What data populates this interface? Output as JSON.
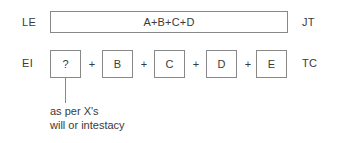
{
  "diagram": {
    "type": "estate-distribution-flow",
    "rows": [
      {
        "left_label": "LE",
        "right_label": "JT",
        "box_text": "A+B+C+D"
      },
      {
        "left_label": "EI",
        "right_label": "TC",
        "operator": "+",
        "boxes": [
          {
            "label": "?"
          },
          {
            "label": "B"
          },
          {
            "label": "C"
          },
          {
            "label": "D"
          },
          {
            "label": "E"
          }
        ]
      }
    ],
    "annotation": {
      "line_1": "as per X's",
      "line_2": "will or intestacy"
    },
    "colors": {
      "background": "#ffffff",
      "border": "#888888",
      "text": "#3a3a3a"
    }
  }
}
